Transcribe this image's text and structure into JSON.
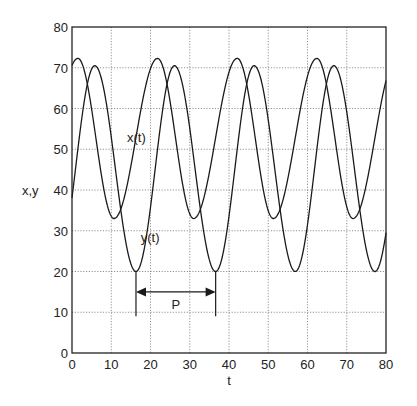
{
  "chart_data": {
    "type": "line",
    "title": "",
    "xlabel": "t",
    "ylabel": "x,y",
    "xlim": [
      0,
      80
    ],
    "ylim": [
      0,
      80
    ],
    "grid": true,
    "xticks": [
      0,
      10,
      20,
      30,
      40,
      50,
      60,
      70,
      80
    ],
    "yticks": [
      0,
      10,
      20,
      30,
      40,
      50,
      60,
      70,
      80
    ],
    "period": 20.3,
    "series": [
      {
        "name": "x(t)",
        "label_pos": [
          14,
          53
        ],
        "max": 72.3,
        "min": 33,
        "peak_times": [
          1.5,
          21.8,
          42.1,
          62.4
        ],
        "trough_times": [
          10.7,
          31.0,
          51.3,
          71.6
        ],
        "x": [
          0,
          1.5,
          5,
          8,
          10.7,
          14,
          18,
          21.8,
          25,
          28,
          31.0,
          34.3,
          38.3,
          42.1,
          45.3,
          48.3,
          51.3,
          54.6,
          58.6,
          62.4,
          65.6,
          68.6,
          71.6,
          74.9,
          78.9,
          80
        ],
        "values": [
          71,
          72.3,
          63,
          42,
          33,
          38,
          58,
          72.3,
          63,
          42,
          33,
          38,
          58,
          72.3,
          63,
          42,
          33,
          38,
          58,
          72.3,
          63,
          42,
          33,
          38,
          58,
          63
        ]
      },
      {
        "name": "y(t)",
        "label_pos": [
          17.5,
          28.5
        ],
        "max": 70.5,
        "min": 20,
        "peak_times": [
          5.8,
          26.1,
          46.4,
          66.7
        ],
        "trough_times": [
          16.3,
          36.6,
          56.9,
          77.2
        ],
        "x": [
          0,
          2,
          5.8,
          9,
          12,
          16.3,
          20,
          23,
          26.1,
          29.3,
          32.3,
          36.6,
          40.3,
          43.3,
          46.4,
          49.6,
          52.6,
          56.9,
          60.6,
          63.6,
          66.7,
          69.9,
          72.9,
          77.2,
          80
        ],
        "values": [
          32,
          52,
          70.5,
          55,
          33,
          20,
          33,
          55,
          70.5,
          55,
          33,
          20,
          33,
          55,
          70.5,
          55,
          33,
          20,
          33,
          55,
          70.5,
          55,
          33,
          20,
          29
        ]
      }
    ],
    "annotations": [
      {
        "type": "double-arrow",
        "label": "P",
        "t_start": 16.3,
        "t_end": 36.6,
        "y": 15,
        "tick_low": 9,
        "tick_high": 20
      }
    ]
  },
  "labels": {
    "xlabel": "t",
    "ylabel": "x,y",
    "x_series": "x(t)",
    "y_series": "y(t)",
    "period": "P"
  }
}
